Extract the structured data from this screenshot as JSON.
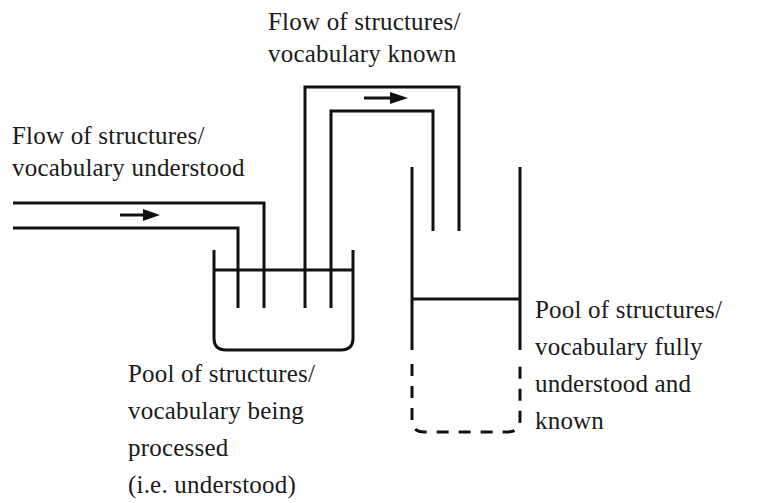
{
  "diagram": {
    "type": "flow-pool-metaphor",
    "stroke_color": "#111111",
    "background": "#ffffff",
    "labels": {
      "flow_understood": {
        "lines": [
          "Flow of structures/",
          "vocabulary understood"
        ]
      },
      "flow_known": {
        "lines": [
          "Flow of structures/",
          "vocabulary known"
        ]
      },
      "pool_processed": {
        "lines": [
          "Pool of structures/",
          "vocabulary being",
          "processed",
          "(i.e. understood)"
        ]
      },
      "pool_known": {
        "lines": [
          "Pool of structures/",
          "vocabulary fully",
          "understood and",
          "known"
        ]
      }
    },
    "nodes": [
      {
        "id": "flow_understood",
        "kind": "pipe",
        "direction": "right"
      },
      {
        "id": "pool_processed",
        "kind": "open-tank"
      },
      {
        "id": "flow_known",
        "kind": "pipe",
        "direction": "right"
      },
      {
        "id": "pool_known",
        "kind": "tall-tank",
        "bottom": "dashed"
      }
    ],
    "edges": [
      {
        "from": "flow_understood",
        "to": "pool_processed"
      },
      {
        "from": "pool_processed",
        "to": "flow_known"
      },
      {
        "from": "flow_known",
        "to": "pool_known"
      }
    ]
  }
}
